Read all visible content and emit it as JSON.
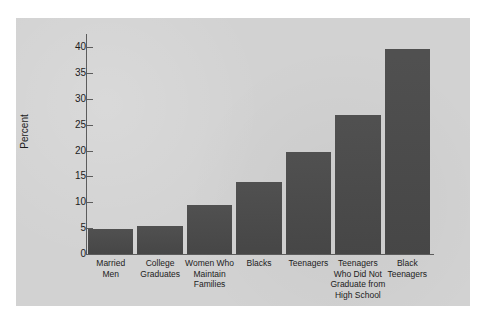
{
  "chart_data": {
    "type": "bar",
    "title": "",
    "subtitle": "",
    "xlabel": "",
    "ylabel": "Percent",
    "ylim": [
      0,
      42
    ],
    "yticks": [
      0,
      5,
      10,
      15,
      20,
      25,
      30,
      35,
      40
    ],
    "ytick_labels": [
      "0",
      "5",
      "10",
      "15",
      "20",
      "25",
      "30",
      "35",
      "40"
    ],
    "grid": false,
    "legend": null,
    "bar_color": "#4a4a4a",
    "panel_color": "#d2d2d2",
    "page_color": "#ffffff",
    "axis_color": "#5c5c5c",
    "categories": [
      "Married Men",
      "College Graduates",
      "Women Who Maintain Families",
      "Blacks",
      "Teenagers",
      "Teenagers Who Did Not Graduate from High School",
      "Black Teenagers"
    ],
    "category_lines": [
      [
        "Married",
        "Men"
      ],
      [
        "College",
        "Graduates"
      ],
      [
        "Women Who",
        "Maintain",
        "Families"
      ],
      [
        "Blacks"
      ],
      [
        "Teenagers"
      ],
      [
        "Teenagers",
        "Who Did Not",
        "Graduate from",
        "High School"
      ],
      [
        "Black",
        "Teenagers"
      ]
    ],
    "values": [
      4.9,
      5.4,
      9.5,
      13.9,
      19.7,
      26.8,
      39.6
    ]
  }
}
